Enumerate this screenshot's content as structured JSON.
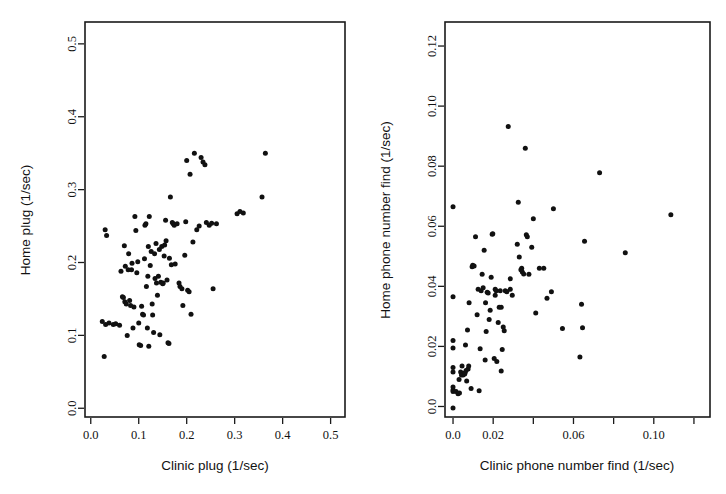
{
  "figure": {
    "background_color": "#ffffff",
    "point_color": "#111111",
    "axis_color": "#1a1a1a",
    "panel_count": 2
  },
  "chart_data": [
    {
      "type": "scatter",
      "panel": "left",
      "title": "",
      "xlabel": "Clinic plug (1/sec)",
      "ylabel": "Home plug (1/sec)",
      "xlim": [
        -0.012,
        0.53
      ],
      "ylim": [
        -0.012,
        0.53
      ],
      "xticks": [
        0.0,
        0.1,
        0.2,
        0.3,
        0.4,
        0.5
      ],
      "xticklabels": [
        "0.0",
        "0.1",
        "0.2",
        "0.3",
        "0.4",
        "0.5"
      ],
      "yticks": [
        0.0,
        0.1,
        0.2,
        0.3,
        0.4,
        0.5
      ],
      "yticklabels": [
        "0.0",
        "0.1",
        "0.2",
        "0.3",
        "0.4",
        "0.5"
      ],
      "grid": false,
      "legend": null,
      "n_points": 104,
      "points": [
        [
          0.028,
          0.071
        ],
        [
          0.024,
          0.119
        ],
        [
          0.03,
          0.245
        ],
        [
          0.033,
          0.237
        ],
        [
          0.031,
          0.115
        ],
        [
          0.038,
          0.117
        ],
        [
          0.047,
          0.115
        ],
        [
          0.052,
          0.116
        ],
        [
          0.06,
          0.114
        ],
        [
          0.066,
          0.153
        ],
        [
          0.068,
          0.152
        ],
        [
          0.063,
          0.188
        ],
        [
          0.07,
          0.223
        ],
        [
          0.072,
          0.195
        ],
        [
          0.071,
          0.146
        ],
        [
          0.074,
          0.143
        ],
        [
          0.076,
          0.1
        ],
        [
          0.078,
          0.19
        ],
        [
          0.079,
          0.212
        ],
        [
          0.081,
          0.148
        ],
        [
          0.083,
          0.141
        ],
        [
          0.085,
          0.19
        ],
        [
          0.086,
          0.199
        ],
        [
          0.088,
          0.11
        ],
        [
          0.09,
          0.139
        ],
        [
          0.092,
          0.263
        ],
        [
          0.094,
          0.244
        ],
        [
          0.096,
          0.186
        ],
        [
          0.098,
          0.201
        ],
        [
          0.1,
          0.117
        ],
        [
          0.101,
          0.087
        ],
        [
          0.104,
          0.086
        ],
        [
          0.106,
          0.14
        ],
        [
          0.108,
          0.129
        ],
        [
          0.11,
          0.128
        ],
        [
          0.112,
          0.205
        ],
        [
          0.113,
          0.251
        ],
        [
          0.115,
          0.253
        ],
        [
          0.116,
          0.167
        ],
        [
          0.118,
          0.11
        ],
        [
          0.119,
          0.181
        ],
        [
          0.12,
          0.222
        ],
        [
          0.121,
          0.085
        ],
        [
          0.122,
          0.263
        ],
        [
          0.124,
          0.196
        ],
        [
          0.126,
          0.215
        ],
        [
          0.128,
          0.143
        ],
        [
          0.129,
          0.128
        ],
        [
          0.131,
          0.104
        ],
        [
          0.133,
          0.212
        ],
        [
          0.134,
          0.178
        ],
        [
          0.136,
          0.226
        ],
        [
          0.137,
          0.172
        ],
        [
          0.139,
          0.155
        ],
        [
          0.141,
          0.181
        ],
        [
          0.143,
          0.218
        ],
        [
          0.144,
          0.101
        ],
        [
          0.146,
          0.173
        ],
        [
          0.148,
          0.222
        ],
        [
          0.15,
          0.171
        ],
        [
          0.151,
          0.172
        ],
        [
          0.153,
          0.209
        ],
        [
          0.154,
          0.224
        ],
        [
          0.156,
          0.258
        ],
        [
          0.157,
          0.23
        ],
        [
          0.159,
          0.176
        ],
        [
          0.161,
          0.09
        ],
        [
          0.163,
          0.089
        ],
        [
          0.164,
          0.206
        ],
        [
          0.166,
          0.29
        ],
        [
          0.168,
          0.197
        ],
        [
          0.17,
          0.255
        ],
        [
          0.172,
          0.253
        ],
        [
          0.174,
          0.251
        ],
        [
          0.176,
          0.198
        ],
        [
          0.18,
          0.253
        ],
        [
          0.184,
          0.172
        ],
        [
          0.186,
          0.167
        ],
        [
          0.19,
          0.164
        ],
        [
          0.192,
          0.141
        ],
        [
          0.196,
          0.21
        ],
        [
          0.198,
          0.256
        ],
        [
          0.2,
          0.34
        ],
        [
          0.202,
          0.162
        ],
        [
          0.205,
          0.16
        ],
        [
          0.207,
          0.321
        ],
        [
          0.209,
          0.129
        ],
        [
          0.213,
          0.228
        ],
        [
          0.216,
          0.35
        ],
        [
          0.221,
          0.245
        ],
        [
          0.226,
          0.25
        ],
        [
          0.23,
          0.344
        ],
        [
          0.234,
          0.338
        ],
        [
          0.238,
          0.334
        ],
        [
          0.241,
          0.255
        ],
        [
          0.247,
          0.251
        ],
        [
          0.252,
          0.254
        ],
        [
          0.255,
          0.164
        ],
        [
          0.262,
          0.253
        ],
        [
          0.305,
          0.267
        ],
        [
          0.311,
          0.27
        ],
        [
          0.318,
          0.268
        ],
        [
          0.357,
          0.29
        ],
        [
          0.364,
          0.35
        ]
      ]
    },
    {
      "type": "scatter",
      "panel": "right",
      "title": "",
      "xlabel": "Clinic phone number find (1/sec)",
      "ylabel": "Home phone number find (1/sec)",
      "xlim": [
        -0.004,
        0.128
      ],
      "ylim": [
        -0.0035,
        0.128
      ],
      "xticks": [
        0.0,
        0.02,
        0.04,
        0.06,
        0.08,
        0.1,
        0.12
      ],
      "xticklabels": [
        "0.0",
        "0.02",
        "",
        "0.06",
        "",
        "0.10",
        ""
      ],
      "yticks": [
        0.0,
        0.02,
        0.04,
        0.06,
        0.08,
        0.1,
        0.12
      ],
      "yticklabels": [
        "0.0",
        "0.02",
        "0.04",
        "0.06",
        "0.08",
        "0.10",
        "0.12"
      ],
      "grid": false,
      "legend": null,
      "n_points": 98,
      "points": [
        [
          0.0,
          -0.0005
        ],
        [
          0.0,
          0.005
        ],
        [
          0.0,
          0.0055
        ],
        [
          0.0,
          0.0065
        ],
        [
          0.0,
          0.0115
        ],
        [
          0.0,
          0.013
        ],
        [
          0.0,
          0.0195
        ],
        [
          0.0,
          0.022
        ],
        [
          0.0,
          0.0365
        ],
        [
          0.0,
          0.0665
        ],
        [
          0.0015,
          0.005
        ],
        [
          0.0025,
          0.0042
        ],
        [
          0.003,
          0.009
        ],
        [
          0.0032,
          0.0045
        ],
        [
          0.0038,
          0.0115
        ],
        [
          0.0042,
          0.0105
        ],
        [
          0.0045,
          0.0135
        ],
        [
          0.005,
          0.0105
        ],
        [
          0.0052,
          0.0108
        ],
        [
          0.0055,
          0.011
        ],
        [
          0.0058,
          0.0108
        ],
        [
          0.006,
          0.0112
        ],
        [
          0.0062,
          0.0205
        ],
        [
          0.0065,
          0.012
        ],
        [
          0.0068,
          0.0085
        ],
        [
          0.0072,
          0.0255
        ],
        [
          0.0075,
          0.0125
        ],
        [
          0.0078,
          0.0135
        ],
        [
          0.008,
          0.0345
        ],
        [
          0.009,
          0.006
        ],
        [
          0.0095,
          0.0465
        ],
        [
          0.0098,
          0.047
        ],
        [
          0.0105,
          0.0468
        ],
        [
          0.0112,
          0.0565
        ],
        [
          0.012,
          0.0305
        ],
        [
          0.0125,
          0.039
        ],
        [
          0.013,
          0.0052
        ],
        [
          0.0135,
          0.0192
        ],
        [
          0.014,
          0.0385
        ],
        [
          0.0145,
          0.044
        ],
        [
          0.015,
          0.0395
        ],
        [
          0.0155,
          0.052
        ],
        [
          0.016,
          0.0155
        ],
        [
          0.0165,
          0.025
        ],
        [
          0.017,
          0.038
        ],
        [
          0.0175,
          0.0378
        ],
        [
          0.018,
          0.029
        ],
        [
          0.0185,
          0.032
        ],
        [
          0.019,
          0.043
        ],
        [
          0.0195,
          0.0573
        ],
        [
          0.0198,
          0.0575
        ],
        [
          0.0205,
          0.016
        ],
        [
          0.021,
          0.037
        ],
        [
          0.0215,
          0.0385
        ],
        [
          0.0218,
          0.015
        ],
        [
          0.0225,
          0.028
        ],
        [
          0.023,
          0.033
        ],
        [
          0.0235,
          0.0385
        ],
        [
          0.024,
          0.0118
        ],
        [
          0.0245,
          0.019
        ],
        [
          0.025,
          0.0265
        ],
        [
          0.0255,
          0.0252
        ],
        [
          0.026,
          0.0385
        ],
        [
          0.0268,
          0.0382
        ],
        [
          0.0275,
          0.0932
        ],
        [
          0.0285,
          0.039
        ],
        [
          0.0295,
          0.037
        ],
        [
          0.032,
          0.054
        ],
        [
          0.0325,
          0.068
        ],
        [
          0.033,
          0.0498
        ],
        [
          0.0338,
          0.0455
        ],
        [
          0.0342,
          0.046
        ],
        [
          0.0345,
          0.0448
        ],
        [
          0.0352,
          0.0441
        ],
        [
          0.036,
          0.086
        ],
        [
          0.0365,
          0.0572
        ],
        [
          0.037,
          0.0565
        ],
        [
          0.0378,
          0.044
        ],
        [
          0.0392,
          0.053
        ],
        [
          0.04,
          0.0625
        ],
        [
          0.0412,
          0.0311
        ],
        [
          0.043,
          0.046
        ],
        [
          0.0452,
          0.046
        ],
        [
          0.0468,
          0.036
        ],
        [
          0.049,
          0.0382
        ],
        [
          0.05,
          0.0658
        ],
        [
          0.0545,
          0.026
        ],
        [
          0.0632,
          0.0165
        ],
        [
          0.064,
          0.034
        ],
        [
          0.0645,
          0.0262
        ],
        [
          0.0655,
          0.055
        ],
        [
          0.073,
          0.0778
        ],
        [
          0.0858,
          0.0512
        ],
        [
          0.1085,
          0.0638
        ],
        [
          0.0285,
          0.0425
        ],
        [
          0.021,
          0.039
        ],
        [
          0.024,
          0.033
        ],
        [
          0.0162,
          0.0345
        ]
      ]
    }
  ]
}
